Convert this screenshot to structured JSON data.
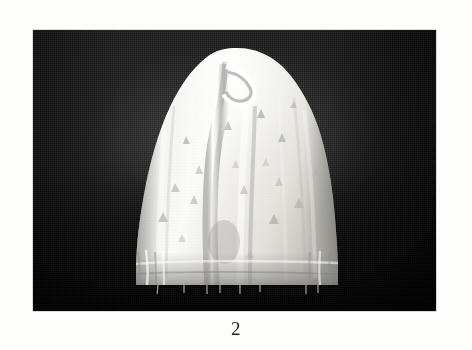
{
  "page": {
    "background_color": "#fdfdfc",
    "type": "photographic-plate"
  },
  "plate": {
    "alt_label": "photograph of a white triangle-printed fabric cap on dark cloth backdrop",
    "backdrop_color": "#131313",
    "backdrop_description": "dark woven cloth backdrop",
    "subject": {
      "name": "fabric-cap",
      "description": "white cotton cap / bonnet, dome shaped, with vertical centre fold, gathered hem and scattered grey triangle print motifs",
      "fabric_color": "#f2f1ec",
      "motif_color": "#b6b6b2",
      "motif_shape": "triangle",
      "motif_count": 18,
      "hem_pin_count": 8,
      "hem_pin_color": "#9a9a96"
    }
  },
  "caption": {
    "figure_number": "2"
  }
}
